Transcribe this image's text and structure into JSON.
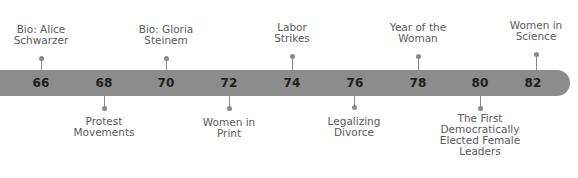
{
  "timeline": {
    "bar_color": "#8c8c8c",
    "years": [
      {
        "label": "66",
        "x": 41
      },
      {
        "label": "68",
        "x": 104
      },
      {
        "label": "70",
        "x": 166
      },
      {
        "label": "72",
        "x": 229
      },
      {
        "label": "74",
        "x": 292
      },
      {
        "label": "76",
        "x": 355
      },
      {
        "label": "78",
        "x": 418
      },
      {
        "label": "80",
        "x": 480
      },
      {
        "label": "82",
        "x": 533
      }
    ],
    "events_above": [
      {
        "year": "66",
        "lines": [
          "Bio: Alice",
          "Schwarzer"
        ]
      },
      {
        "year": "70",
        "lines": [
          "Bio: Gloria",
          "Steinem"
        ]
      },
      {
        "year": "74",
        "lines": [
          "Labor",
          "Strikes"
        ]
      },
      {
        "year": "78",
        "lines": [
          "Year of the",
          "Woman"
        ]
      },
      {
        "year": "82",
        "lines": [
          "Women in",
          "Science"
        ]
      }
    ],
    "events_below": [
      {
        "year": "68",
        "lines": [
          "Protest",
          "Movements"
        ]
      },
      {
        "year": "72",
        "lines": [
          "Women in",
          "Print"
        ]
      },
      {
        "year": "76",
        "lines": [
          "Legalizing",
          "Divorce"
        ]
      },
      {
        "year": "80",
        "lines": [
          "The First",
          "Democratically",
          "Elected Female",
          "Leaders"
        ]
      }
    ]
  }
}
